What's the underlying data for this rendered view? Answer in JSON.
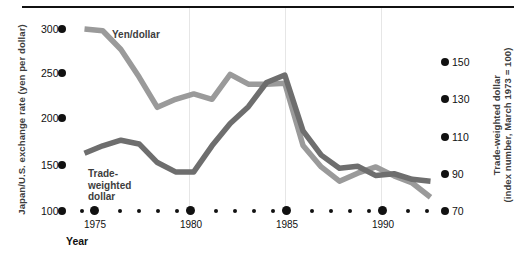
{
  "chart_data": {
    "type": "line",
    "title": "",
    "xlabel": "Year",
    "ylabel_left": "Japan/U.S. exchange rate (yen per dollar)",
    "ylabel_right_line1": "Trade-weighted dollar",
    "ylabel_right_line2": "(index number, March 1973 = 100)",
    "grid": false,
    "legend_position": "inline-annotations",
    "x": [
      1974,
      1975,
      1976,
      1977,
      1978,
      1979,
      1980,
      1981,
      1982,
      1983,
      1984,
      1985,
      1986,
      1987,
      1988,
      1989,
      1990,
      1991,
      1992,
      1993
    ],
    "xlim": [
      1974,
      1993
    ],
    "xticks_major": [
      1975,
      1980,
      1985,
      1990
    ],
    "xtick_labels": [
      "1975",
      "1980",
      "1985",
      "1990"
    ],
    "yticks_left": [
      100,
      150,
      200,
      250,
      300
    ],
    "ytick_labels_left": [
      "100",
      "150",
      "200",
      "250",
      "300"
    ],
    "ylim_left": [
      100,
      300
    ],
    "yticks_right": [
      70,
      90,
      110,
      130,
      150
    ],
    "ytick_labels_right": [
      "70",
      "90",
      "110",
      "130",
      "150"
    ],
    "ylim_right": [
      70,
      150
    ],
    "series": [
      {
        "name": "Yen/dollar",
        "axis": "left",
        "color": "#9a9a9a",
        "values": [
          300,
          298,
          277,
          246,
          212,
          221,
          227,
          221,
          249,
          238,
          238,
          239,
          169,
          145,
          129,
          138,
          145,
          135,
          127,
          111
        ]
      },
      {
        "name": "Trade-weighted dollar",
        "axis": "right",
        "color": "#6e6e6e",
        "values": [
          101,
          105,
          108,
          106,
          96,
          91,
          91,
          105,
          117,
          126,
          139,
          143,
          113,
          100,
          93,
          94,
          89,
          90,
          87,
          86
        ]
      }
    ],
    "annotations": [
      {
        "text": "Yen/dollar",
        "series": "Yen/dollar"
      },
      {
        "text": "Trade-\nweighted\ndollar",
        "series": "Trade-weighted dollar"
      }
    ]
  },
  "labels": {
    "yen_dollar": "Yen/dollar",
    "trade_weighted_l1": "Trade-",
    "trade_weighted_l2": "weighted",
    "trade_weighted_l3": "dollar",
    "year": "Year",
    "axis_left": "Japan/U.S. exchange rate (yen per dollar)",
    "axis_right_l1": "Trade-weighted dollar",
    "axis_right_l2": "(index number, March 1973 = 100)"
  },
  "ticks": {
    "left": [
      "300",
      "250",
      "200",
      "150",
      "100"
    ],
    "right": [
      "150",
      "130",
      "110",
      "90",
      "70"
    ],
    "x": [
      "1975",
      "1980",
      "1985",
      "1990"
    ]
  },
  "colors": {
    "yen_line": "#9a9a9a",
    "twd_line": "#6e6e6e",
    "text": "#111111",
    "label_text": "#3d3d3d",
    "rule": "#111111"
  }
}
